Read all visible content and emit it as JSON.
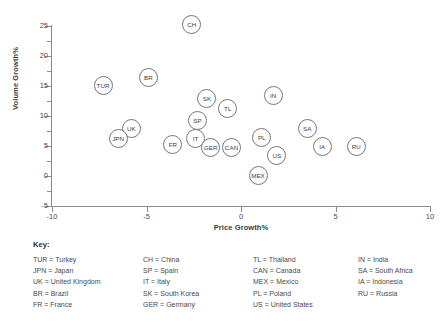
{
  "chart_data": {
    "type": "scatter",
    "title": "",
    "xlabel": "Price Growth%",
    "ylabel": "Volume Growth%",
    "xlim": [
      -10,
      10
    ],
    "ylim": [
      -5,
      25
    ],
    "xticks": [
      "-10",
      "-5",
      "0",
      "5",
      "10"
    ],
    "xtick_values": [
      -10,
      -5,
      0,
      5,
      10
    ],
    "yticks": [
      "-5",
      "0",
      "5",
      "10",
      "15",
      "20",
      "25"
    ],
    "ytick_values": [
      -5,
      0,
      5,
      10,
      15,
      20,
      25
    ],
    "yticks_minor": [
      -2.5,
      2.5,
      7.5,
      12.5,
      17.5,
      22.5
    ],
    "grid": false,
    "legend_position": "below-plot",
    "marker_style": "open-circle-with-label",
    "points": [
      {
        "label": "CH",
        "x": -2.6,
        "y": 25.2
      },
      {
        "label": "TUR",
        "x": -7.3,
        "y": 15.1
      },
      {
        "label": "BR",
        "x": -4.9,
        "y": 16.4
      },
      {
        "label": "SK",
        "x": -1.8,
        "y": 13.0
      },
      {
        "label": "TL",
        "x": -0.7,
        "y": 11.2
      },
      {
        "label": "IN",
        "x": 1.7,
        "y": 13.5
      },
      {
        "label": "SP",
        "x": -2.3,
        "y": 9.3
      },
      {
        "label": "UK",
        "x": -5.8,
        "y": 8.0
      },
      {
        "label": "SA",
        "x": 3.5,
        "y": 8.0
      },
      {
        "label": "JPN",
        "x": -6.5,
        "y": 6.3
      },
      {
        "label": "IT",
        "x": -2.4,
        "y": 6.2
      },
      {
        "label": "PL",
        "x": 1.1,
        "y": 6.4
      },
      {
        "label": "FR",
        "x": -3.6,
        "y": 5.2
      },
      {
        "label": "GER",
        "x": -1.6,
        "y": 4.7
      },
      {
        "label": "CAN",
        "x": -0.5,
        "y": 4.8
      },
      {
        "label": "IA",
        "x": 4.3,
        "y": 5.0
      },
      {
        "label": "RU",
        "x": 6.1,
        "y": 4.9
      },
      {
        "label": "US",
        "x": 1.9,
        "y": 3.5
      },
      {
        "label": "MEX",
        "x": 0.9,
        "y": 0.1
      }
    ]
  },
  "key": {
    "title": "Key:",
    "columns": [
      [
        "TUR = Turkey",
        "JPN = Japan",
        "UK = United Kingdom",
        "BR = Brazil",
        "FR = France"
      ],
      [
        "CH = China",
        "SP = Spain",
        "IT = Italy",
        "SK = South Korea",
        "GER = Germany"
      ],
      [
        "TL = Thailand",
        "CAN = Canada",
        "MEX = Mexico",
        "PL = Poland",
        "US = United States"
      ],
      [
        "IN = India",
        "SA = South Africa",
        "IA = Indonesia",
        "RU = Russia"
      ]
    ]
  },
  "colors": {
    "marker_stroke": "#77777a",
    "marker_fill": "#ffffff",
    "axis": "#8a8a8a",
    "text": "#3b3b3b",
    "background": "#ffffff"
  }
}
